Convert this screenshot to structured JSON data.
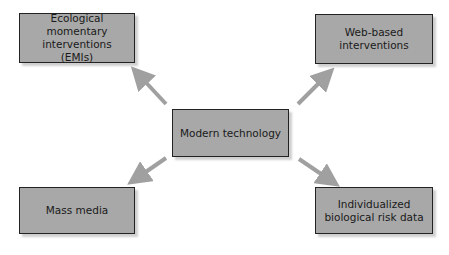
{
  "diagram": {
    "center": {
      "label": "Modern technology"
    },
    "nodes": [
      {
        "id": "tl",
        "label": "Ecological momentary interventions (EMIs)"
      },
      {
        "id": "tr",
        "label": "Web-based interventions"
      },
      {
        "id": "bl",
        "label": "Mass media"
      },
      {
        "id": "br",
        "label": "Individualized biological risk data"
      }
    ],
    "colors": {
      "box_fill": "#a8a8a8",
      "border": "#222222",
      "arrow": "#a0a0a0"
    }
  }
}
